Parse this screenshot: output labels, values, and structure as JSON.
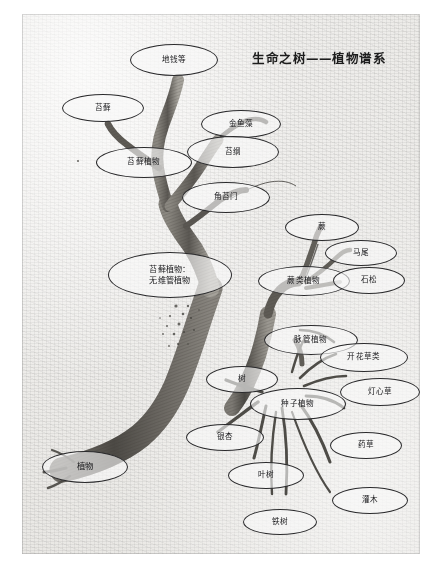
{
  "figure": {
    "title": "生命之树——植物谱系",
    "medium": "hand-drawn pencil sketch on textured paper",
    "background_color": "#f3f2f0",
    "ink_color": "#2a2a2c"
  },
  "nodes": [
    {
      "id": "diqian",
      "label": "地钱等",
      "x": 130,
      "y": 44,
      "w": 88,
      "h": 32
    },
    {
      "id": "taixian",
      "label": "苔藓",
      "x": 62,
      "y": 94,
      "w": 82,
      "h": 28
    },
    {
      "id": "jinyuzao",
      "label": "金鱼藻",
      "x": 201,
      "y": 110,
      "w": 80,
      "h": 28
    },
    {
      "id": "taigang",
      "label": "苔纲",
      "x": 187,
      "y": 136,
      "w": 92,
      "h": 32
    },
    {
      "id": "taixian-zhiwu",
      "label": "苔藓植物",
      "x": 96,
      "y": 147,
      "w": 96,
      "h": 31
    },
    {
      "id": "jiaotaimen",
      "label": "角苔门",
      "x": 182,
      "y": 182,
      "w": 88,
      "h": 31
    },
    {
      "id": "jue",
      "label": "蕨",
      "x": 285,
      "y": 214,
      "w": 74,
      "h": 27
    },
    {
      "id": "mawei",
      "label": "马尾",
      "x": 325,
      "y": 240,
      "w": 72,
      "h": 26
    },
    {
      "id": "taixian-wwg",
      "label": "苔藓植物：\n无维管植物",
      "x": 108,
      "y": 252,
      "w": 124,
      "h": 46
    },
    {
      "id": "juelei",
      "label": "蕨类植物",
      "x": 258,
      "y": 266,
      "w": 92,
      "h": 30
    },
    {
      "id": "shisong",
      "label": "石松",
      "x": 333,
      "y": 267,
      "w": 72,
      "h": 27
    },
    {
      "id": "maiguan",
      "label": "脉管植物",
      "x": 264,
      "y": 325,
      "w": 94,
      "h": 30
    },
    {
      "id": "kaihua",
      "label": "开花草类",
      "x": 320,
      "y": 343,
      "w": 88,
      "h": 29
    },
    {
      "id": "dengxincao",
      "label": "灯心草",
      "x": 340,
      "y": 378,
      "w": 80,
      "h": 28
    },
    {
      "id": "shu",
      "label": "树",
      "x": 206,
      "y": 366,
      "w": 72,
      "h": 27
    },
    {
      "id": "zhongzi",
      "label": "种子植物",
      "x": 250,
      "y": 388,
      "w": 96,
      "h": 32
    },
    {
      "id": "yinxing",
      "label": "银杏",
      "x": 186,
      "y": 424,
      "w": 78,
      "h": 27
    },
    {
      "id": "yaocao",
      "label": "药草",
      "x": 330,
      "y": 432,
      "w": 72,
      "h": 27
    },
    {
      "id": "yeshu",
      "label": "叶树",
      "x": 228,
      "y": 462,
      "w": 76,
      "h": 27
    },
    {
      "id": "guanmu",
      "label": "灌木",
      "x": 332,
      "y": 487,
      "w": 76,
      "h": 27
    },
    {
      "id": "tieshu",
      "label": "铁树",
      "x": 243,
      "y": 509,
      "w": 74,
      "h": 26
    },
    {
      "id": "zhiwu",
      "label": "植物",
      "x": 42,
      "y": 451,
      "w": 86,
      "h": 32
    }
  ],
  "hierarchy": {
    "root": "植物",
    "relations": [
      {
        "parent": "植物",
        "child": "苔藓植物：无维管植物"
      },
      {
        "parent": "植物",
        "child": "脉管植物"
      },
      {
        "parent": "苔藓植物：无维管植物",
        "child": "苔藓植物"
      },
      {
        "parent": "苔藓植物：无维管植物",
        "child": "角苔门"
      },
      {
        "parent": "苔藓植物：无维管植物",
        "child": "苔纲"
      },
      {
        "parent": "苔藓植物",
        "child": "苔藓"
      },
      {
        "parent": "苔藓植物",
        "child": "地钱等"
      },
      {
        "parent": "苔纲",
        "child": "金鱼藻"
      },
      {
        "parent": "脉管植物",
        "child": "蕨类植物"
      },
      {
        "parent": "脉管植物",
        "child": "种子植物"
      },
      {
        "parent": "脉管植物",
        "child": "开花草类"
      },
      {
        "parent": "蕨类植物",
        "child": "蕨"
      },
      {
        "parent": "蕨类植物",
        "child": "马尾"
      },
      {
        "parent": "蕨类植物",
        "child": "石松"
      },
      {
        "parent": "种子植物",
        "child": "树"
      },
      {
        "parent": "种子植物",
        "child": "银杏"
      },
      {
        "parent": "种子植物",
        "child": "叶树"
      },
      {
        "parent": "种子植物",
        "child": "铁树"
      },
      {
        "parent": "种子植物",
        "child": "灌木"
      },
      {
        "parent": "种子植物",
        "child": "灯心草"
      },
      {
        "parent": "种子植物",
        "child": "药草"
      }
    ]
  }
}
